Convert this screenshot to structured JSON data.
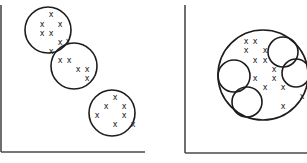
{
  "diagram": {
    "panels": [
      {
        "id": "left",
        "description": "three separate clusters",
        "axes": {
          "x1": 1,
          "y_top": 5,
          "y_bottom": 152,
          "x_end": 145
        },
        "circles": [
          {
            "cx": 48,
            "cy": 30,
            "r": 23
          },
          {
            "cx": 74,
            "cy": 66,
            "r": 23
          },
          {
            "cx": 112,
            "cy": 113,
            "r": 23
          }
        ],
        "points": [
          {
            "x": 51,
            "y": 14
          },
          {
            "x": 42,
            "y": 24
          },
          {
            "x": 60,
            "y": 24
          },
          {
            "x": 42,
            "y": 33
          },
          {
            "x": 51,
            "y": 33
          },
          {
            "x": 60,
            "y": 42
          },
          {
            "x": 68,
            "y": 41
          },
          {
            "x": 51,
            "y": 51
          },
          {
            "x": 60,
            "y": 60
          },
          {
            "x": 69,
            "y": 60
          },
          {
            "x": 78,
            "y": 69
          },
          {
            "x": 87,
            "y": 69
          },
          {
            "x": 87,
            "y": 78
          },
          {
            "x": 115,
            "y": 97
          },
          {
            "x": 106,
            "y": 106
          },
          {
            "x": 124,
            "y": 106
          },
          {
            "x": 97,
            "y": 115
          },
          {
            "x": 124,
            "y": 115
          },
          {
            "x": 115,
            "y": 124
          },
          {
            "x": 133,
            "y": 124
          }
        ],
        "point_glyph": "x"
      },
      {
        "id": "right",
        "description": "one large enclosing cluster containing four sub-clusters",
        "axes": {
          "x1": 185,
          "y_top": 5,
          "y_bottom": 153,
          "x_end": 307
        },
        "circles": [
          {
            "cx": 263,
            "cy": 75,
            "r": 45
          },
          {
            "cx": 283,
            "cy": 52,
            "r": 15
          },
          {
            "cx": 296,
            "cy": 73,
            "r": 14
          },
          {
            "cx": 234,
            "cy": 76,
            "r": 16
          },
          {
            "cx": 247,
            "cy": 102,
            "r": 15
          }
        ],
        "points": [
          {
            "x": 246,
            "y": 41
          },
          {
            "x": 255,
            "y": 41
          },
          {
            "x": 246,
            "y": 50
          },
          {
            "x": 265,
            "y": 50
          },
          {
            "x": 255,
            "y": 60
          },
          {
            "x": 265,
            "y": 60
          },
          {
            "x": 274,
            "y": 69
          },
          {
            "x": 255,
            "y": 78
          },
          {
            "x": 274,
            "y": 78
          },
          {
            "x": 265,
            "y": 87
          },
          {
            "x": 283,
            "y": 87
          },
          {
            "x": 302,
            "y": 96
          },
          {
            "x": 283,
            "y": 106
          }
        ],
        "point_glyph": "x"
      }
    ],
    "colors": {
      "ink": "#1c1c1c",
      "axis": "#4a4a4a",
      "background": "#ffffff"
    }
  }
}
